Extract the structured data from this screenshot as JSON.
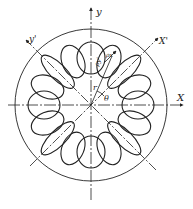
{
  "figure": {
    "type": "stress-ellipse ring diagram",
    "center": [
      91,
      105
    ],
    "outer_circle_radius": 76,
    "ring_radius": 47,
    "ellipse_count": 16,
    "line_color": "#222222"
  },
  "labels": {
    "y_axis": "y",
    "x_axis": "X",
    "x_prime_axis": "X'",
    "y_prime_axis": "y'",
    "radius": "r",
    "angle": "θ",
    "rho_x": "ρx'",
    "rho_y": "ρy'"
  }
}
